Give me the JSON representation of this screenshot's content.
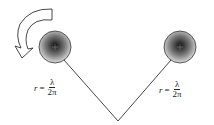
{
  "diagram": {
    "type": "two rotating spheres on V-shaped tether",
    "left_sphere": {
      "cx": 55,
      "cy": 47,
      "r": 16
    },
    "right_sphere": {
      "cx": 180,
      "cy": 47,
      "r": 16
    },
    "vertex": {
      "x": 118,
      "y": 121
    },
    "rotation_arrow": "counterclockwise",
    "colors": {
      "line": "#333333",
      "sphere_dark": "#111111",
      "sphere_light": "#d8d8d8",
      "arrow_fill": "#ffffff"
    },
    "labels": {
      "left": {
        "lhs": "r",
        "eq": "=",
        "num": "λ",
        "den": "2π"
      },
      "right": {
        "lhs": "r",
        "eq": "=",
        "num": "λ",
        "den": "2π"
      }
    }
  }
}
